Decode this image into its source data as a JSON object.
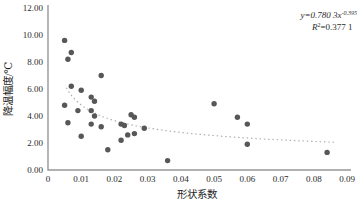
{
  "chart_data": {
    "type": "scatter",
    "title": "",
    "xlabel": "形状系数",
    "ylabel": "降温幅度/℃",
    "xlim": [
      0,
      0.09
    ],
    "ylim": [
      0,
      12
    ],
    "grid": false,
    "legend": "none",
    "x_tick_labels": [
      "0",
      "0.01",
      "0.02",
      "0.03",
      "0.04",
      "0.05",
      "0.06",
      "0.07",
      "0.08",
      "0.09"
    ],
    "y_tick_labels": [
      "0.00",
      "2.00",
      "4.00",
      "6.00",
      "8.00",
      "10.00",
      "12.00"
    ],
    "points": [
      [
        0.005,
        9.6
      ],
      [
        0.007,
        8.7
      ],
      [
        0.006,
        8.2
      ],
      [
        0.016,
        7.0
      ],
      [
        0.007,
        6.2
      ],
      [
        0.01,
        5.9
      ],
      [
        0.013,
        5.4
      ],
      [
        0.014,
        5.1
      ],
      [
        0.005,
        4.8
      ],
      [
        0.009,
        4.4
      ],
      [
        0.013,
        4.4
      ],
      [
        0.014,
        4.0
      ],
      [
        0.006,
        3.5
      ],
      [
        0.013,
        3.4
      ],
      [
        0.016,
        3.2
      ],
      [
        0.01,
        2.5
      ],
      [
        0.018,
        1.5
      ],
      [
        0.022,
        3.4
      ],
      [
        0.023,
        3.3
      ],
      [
        0.025,
        4.1
      ],
      [
        0.026,
        3.9
      ],
      [
        0.029,
        3.1
      ],
      [
        0.024,
        2.6
      ],
      [
        0.026,
        2.7
      ],
      [
        0.022,
        2.2
      ],
      [
        0.036,
        0.7
      ],
      [
        0.05,
        4.9
      ],
      [
        0.057,
        3.9
      ],
      [
        0.06,
        3.4
      ],
      [
        0.06,
        1.9
      ],
      [
        0.084,
        1.3
      ]
    ],
    "trendline": {
      "type": "power",
      "coefficient": 0.7803,
      "exponent": -0.395,
      "x_range": [
        0.0055,
        0.0865
      ],
      "equation_base": "y=0.780 3x",
      "equation_exponent": "-0.395",
      "r2_symbol": "R",
      "r2_sup": "2",
      "r2_rest": "=0.377 1"
    },
    "colors": {
      "point": "#575757",
      "trend": "#b0b0b0",
      "axis": "#979797",
      "text": "#2b2b2b"
    }
  }
}
